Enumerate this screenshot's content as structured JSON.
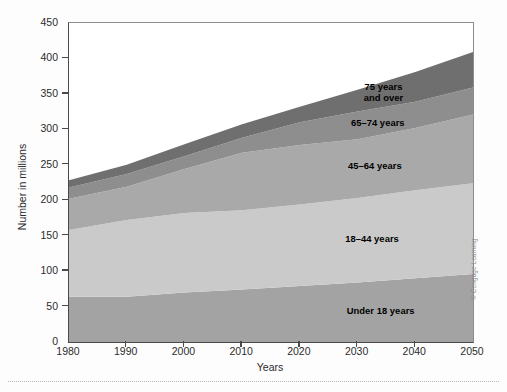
{
  "figure": {
    "credit": "© Cengage Learning"
  },
  "chart_data": {
    "type": "area",
    "stacked": true,
    "title": "",
    "xlabel": "Years",
    "ylabel": "Number in millions",
    "xlim": [
      1980,
      2050
    ],
    "ylim": [
      0,
      450
    ],
    "ytick_labels": [
      "0",
      "50",
      "100",
      "150",
      "200",
      "250",
      "300",
      "350",
      "400",
      "450"
    ],
    "yticks": [
      0,
      50,
      100,
      150,
      200,
      250,
      300,
      350,
      400,
      450
    ],
    "xtick_labels": [
      "1980",
      "1990",
      "2000",
      "2010",
      "2020",
      "2030",
      "2040",
      "2050"
    ],
    "xticks": [
      1980,
      1990,
      2000,
      2010,
      2020,
      2030,
      2040,
      2050
    ],
    "grid": false,
    "legend_position": "inline-labels",
    "x": [
      1980,
      1990,
      2000,
      2010,
      2020,
      2030,
      2040,
      2050
    ],
    "series": [
      {
        "name": "Under 18 years",
        "label": "Under 18 years",
        "color": "#a3a3a3",
        "values": [
          64,
          64,
          70,
          74,
          79,
          84,
          90,
          96
        ]
      },
      {
        "name": "18-44 years",
        "label": "18–44 years",
        "color": "#cacaca",
        "values": [
          94,
          108,
          112,
          112,
          115,
          119,
          124,
          128
        ]
      },
      {
        "name": "45-64 years",
        "label": "45–64 years",
        "color": "#a9a9a9",
        "values": [
          44,
          47,
          62,
          81,
          84,
          83,
          88,
          97
        ]
      },
      {
        "name": "65-74 years",
        "label": "65–74 years",
        "color": "#8e8e8e",
        "values": [
          16,
          18,
          18,
          21,
          32,
          39,
          37,
          38
        ]
      },
      {
        "name": "75 years and over",
        "label": "75 years\nand over",
        "color": "#6f6f6f",
        "values": [
          10,
          13,
          17,
          19,
          22,
          31,
          42,
          50
        ]
      }
    ],
    "totals": [
      228,
      250,
      279,
      307,
      332,
      356,
      381,
      409
    ],
    "annotations": [
      {
        "text": "75 years\nand over",
        "series": "75 years and over"
      },
      {
        "text": "65–74 years",
        "series": "65-74 years"
      },
      {
        "text": "45–64 years",
        "series": "45-64 years"
      },
      {
        "text": "18–44 years",
        "series": "18-44 years"
      },
      {
        "text": "Under 18 years",
        "series": "Under 18 years"
      }
    ]
  }
}
